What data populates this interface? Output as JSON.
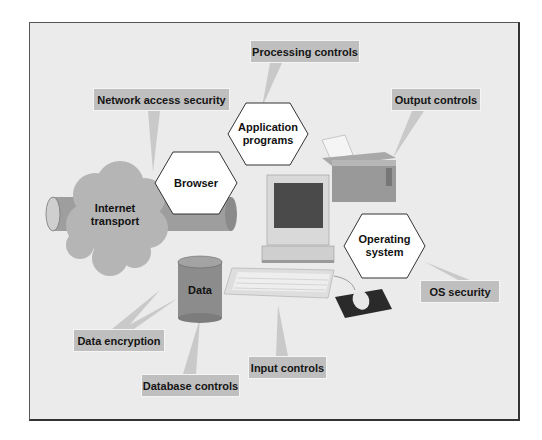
{
  "diagram": {
    "type": "system-security-controls",
    "colors": {
      "background": "#ebebeb",
      "label_box": "#bfbfbf",
      "hexagon_fill": "#ffffff",
      "cloud": "#b4b4b4",
      "pipe": "#9a9a9a",
      "cylinder": "#8c8c8c",
      "frame_border": "#444444"
    },
    "nodes": {
      "internet": "Internet transport",
      "internet_l1": "Internet",
      "internet_l2": "transport",
      "browser": "Browser",
      "application_l1": "Application",
      "application_l2": "programs",
      "os_l1": "Operating",
      "os_l2": "system",
      "data": "Data"
    },
    "labels": {
      "processing": "Processing controls",
      "network": "Network access security",
      "output": "Output controls",
      "os_security": "OS security",
      "encryption": "Data encryption",
      "database": "Database controls",
      "input": "Input controls"
    }
  }
}
